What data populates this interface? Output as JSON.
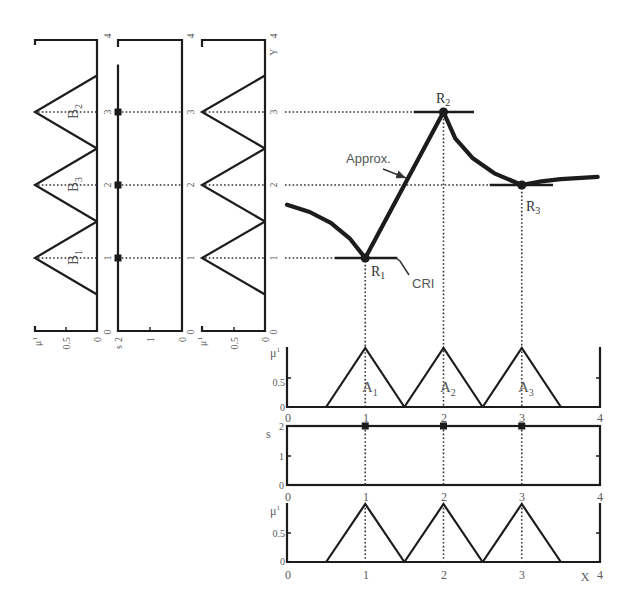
{
  "panels": {
    "b_membership": {
      "y_ticks": [
        "4",
        "3",
        "2",
        "1",
        "0"
      ],
      "mu_label": "μ",
      "mu_ticks": [
        "1",
        "0.5",
        "0"
      ],
      "set_labels": [
        {
          "name": "B",
          "sub": "2"
        },
        {
          "name": "B",
          "sub": "3"
        },
        {
          "name": "B",
          "sub": "1"
        }
      ]
    },
    "y_strength": {
      "y_ticks": [
        "4",
        "3",
        "2",
        "1",
        "0"
      ],
      "s_label": "s",
      "s_ticks": [
        "2",
        "1",
        "0"
      ]
    },
    "y_membership_2": {
      "y_label": "Y",
      "y_ticks": [
        "4",
        "3",
        "2",
        "1",
        "0"
      ],
      "mu_label": "μ",
      "mu_ticks": [
        "1",
        "0.5",
        "0"
      ]
    },
    "main": {
      "approx_label": "Approx.",
      "cri_label": "CRI",
      "points": [
        {
          "name": "R",
          "sub": "1"
        },
        {
          "name": "R",
          "sub": "2"
        },
        {
          "name": "R",
          "sub": "3"
        }
      ]
    },
    "a_membership": {
      "mu_label": "μ",
      "mu_ticks": [
        "1",
        "0.5",
        "0"
      ],
      "x_ticks": [
        "0",
        "1",
        "2",
        "3",
        "4"
      ],
      "set_labels": [
        {
          "name": "A",
          "sub": "1"
        },
        {
          "name": "A",
          "sub": "2"
        },
        {
          "name": "A",
          "sub": "3"
        }
      ]
    },
    "x_strength": {
      "s_label": "s",
      "s_ticks": [
        "2",
        "1",
        "0"
      ],
      "x_ticks": [
        "0",
        "1",
        "2",
        "3",
        "4"
      ]
    },
    "x_membership_2": {
      "mu_label": "μ",
      "mu_ticks": [
        "1",
        "0.5",
        "0"
      ],
      "x_label": "X",
      "x_ticks": [
        "0",
        "1",
        "2",
        "3",
        "4"
      ]
    }
  },
  "colors": {
    "line": "#1c1c1c",
    "label": "#5a5a5a"
  },
  "chart_data": {
    "type": "line",
    "title": "",
    "layout": "3 rotated output panels (left), main X-Y plot (top right), 3 input panels (bottom right)",
    "subplots": [
      {
        "id": "main",
        "type": "line",
        "xlabel": "X",
        "ylabel": "Y",
        "xlim": [
          0,
          4
        ],
        "ylim": [
          0,
          4
        ],
        "grid": false,
        "series": [
          {
            "name": "Approx.",
            "x": [
              0,
              0.29,
              0.56,
              0.8,
              1,
              2,
              2.15,
              2.37,
              2.65,
              3,
              3.25,
              3.5,
              3.97
            ],
            "y": [
              1.73,
              1.63,
              1.48,
              1.27,
              1,
              3,
              2.64,
              2.37,
              2.16,
              2,
              2.05,
              2.08,
              2.11
            ]
          }
        ],
        "points": [
          {
            "label": "R1",
            "x": 1,
            "y": 1
          },
          {
            "label": "R2",
            "x": 2,
            "y": 3
          },
          {
            "label": "R3",
            "x": 3,
            "y": 2
          }
        ],
        "tangents": [
          {
            "point": "R1",
            "x": [
              0.61,
              1.41
            ],
            "y": 1
          },
          {
            "point": "R2",
            "x": [
              1.62,
              2.39
            ],
            "y": 3
          },
          {
            "point": "R3",
            "x": [
              2.59,
              3.4
            ],
            "y": 2
          }
        ],
        "annotations": [
          {
            "text": "Approx.",
            "points_to": "curve segment between R1 and R2"
          },
          {
            "text": "CRI",
            "points_to": "horizontal tangent at R1"
          }
        ]
      },
      {
        "id": "b_membership",
        "type": "line",
        "orientation": "rotated",
        "xlabel": "μ",
        "ylabel": "Y",
        "xlim": [
          1,
          0
        ],
        "ylim": [
          0,
          4
        ],
        "series": [
          {
            "name": "B1",
            "peak": 1,
            "support": [
              0.5,
              1.5
            ]
          },
          {
            "name": "B3",
            "peak": 2,
            "support": [
              1.5,
              2.5
            ]
          },
          {
            "name": "B2",
            "peak": 3,
            "support": [
              2.5,
              3.5
            ]
          }
        ]
      },
      {
        "id": "y_strength",
        "type": "scatter",
        "orientation": "rotated",
        "xlabel": "s",
        "ylabel": "Y",
        "xlim": [
          2,
          0
        ],
        "ylim": [
          0,
          4
        ],
        "series": [
          {
            "name": "s",
            "y": [
              1,
              2,
              3
            ],
            "s": [
              2,
              2,
              2
            ]
          }
        ],
        "line": {
          "s": 2,
          "y_range": [
            0,
            3.65
          ]
        }
      },
      {
        "id": "y_membership_2",
        "type": "line",
        "orientation": "rotated",
        "xlabel": "μ",
        "ylabel": "Y",
        "xlim": [
          1,
          0
        ],
        "ylim": [
          0,
          4
        ],
        "series": [
          {
            "name": "",
            "peak": 1,
            "support": [
              0.5,
              1.5
            ]
          },
          {
            "name": "",
            "peak": 2,
            "support": [
              1.5,
              2.5
            ]
          },
          {
            "name": "",
            "peak": 3,
            "support": [
              2.5,
              3.5
            ]
          }
        ]
      },
      {
        "id": "a_membership",
        "type": "line",
        "xlabel": "X",
        "ylabel": "μ",
        "xlim": [
          0,
          4
        ],
        "ylim": [
          0,
          1
        ],
        "series": [
          {
            "name": "A1",
            "peak": 1,
            "support": [
              0.5,
              1.5
            ]
          },
          {
            "name": "A2",
            "peak": 2,
            "support": [
              1.5,
              2.5
            ]
          },
          {
            "name": "A3",
            "peak": 3,
            "support": [
              2.5,
              3.5
            ]
          }
        ]
      },
      {
        "id": "x_strength",
        "type": "scatter",
        "xlabel": "X",
        "ylabel": "s",
        "xlim": [
          0,
          4
        ],
        "ylim": [
          0,
          2
        ],
        "series": [
          {
            "name": "s",
            "x": [
              1,
              2,
              3
            ],
            "s": [
              2,
              2,
              2
            ]
          }
        ]
      },
      {
        "id": "x_membership_2",
        "type": "line",
        "xlabel": "X",
        "ylabel": "μ",
        "xlim": [
          0,
          4
        ],
        "ylim": [
          0,
          1
        ],
        "series": [
          {
            "name": "",
            "peak": 1,
            "support": [
              0.5,
              1.5
            ]
          },
          {
            "name": "",
            "peak": 2,
            "support": [
              1.5,
              2.5
            ]
          },
          {
            "name": "",
            "peak": 3,
            "support": [
              2.5,
              3.5
            ]
          }
        ]
      }
    ]
  }
}
